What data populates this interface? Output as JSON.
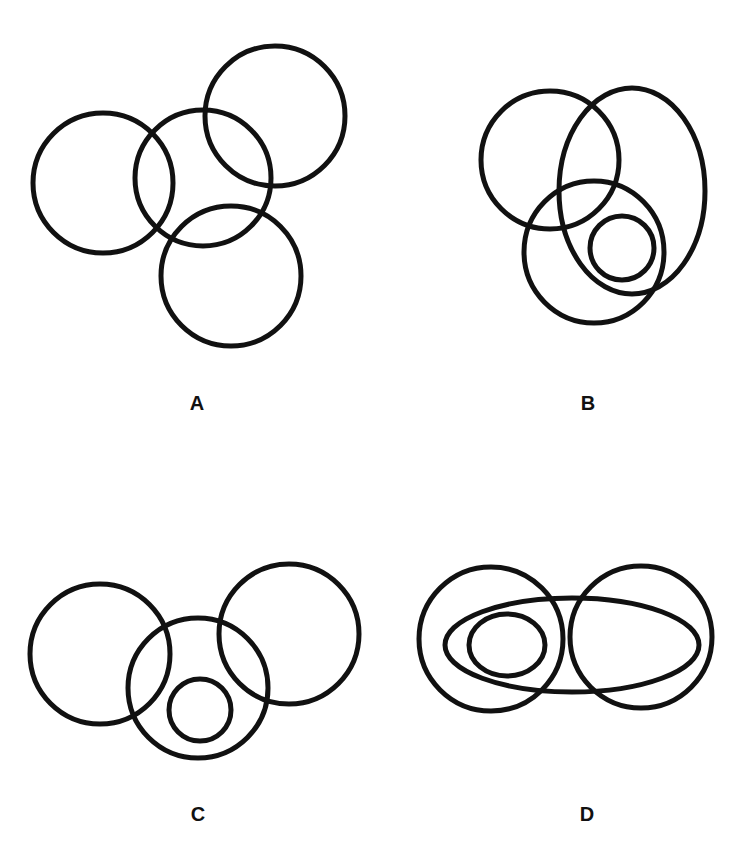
{
  "stroke_color": "#111111",
  "background_color": "#ffffff",
  "panels": [
    {
      "label": "A",
      "label_pos": [
        197,
        403
      ],
      "shapes": [
        {
          "type": "circle",
          "cx": 103,
          "cy": 183,
          "r": 70
        },
        {
          "type": "circle",
          "cx": 203,
          "cy": 178,
          "r": 68
        },
        {
          "type": "circle",
          "cx": 275,
          "cy": 116,
          "r": 70
        },
        {
          "type": "circle",
          "cx": 231,
          "cy": 276,
          "r": 70
        }
      ]
    },
    {
      "label": "B",
      "label_pos": [
        588,
        403
      ],
      "shapes": [
        {
          "type": "circle",
          "cx": 550,
          "cy": 160,
          "r": 69
        },
        {
          "type": "ellipse",
          "cx": 632,
          "cy": 191,
          "rx": 73,
          "ry": 103
        },
        {
          "type": "ellipse",
          "cx": 594,
          "cy": 252,
          "rx": 70,
          "ry": 71
        },
        {
          "type": "circle",
          "cx": 622,
          "cy": 248,
          "r": 32
        }
      ]
    },
    {
      "label": "C",
      "label_pos": [
        198,
        814
      ],
      "shapes": [
        {
          "type": "circle",
          "cx": 100,
          "cy": 654,
          "r": 70
        },
        {
          "type": "circle",
          "cx": 198,
          "cy": 688,
          "r": 70
        },
        {
          "type": "circle",
          "cx": 289,
          "cy": 634,
          "r": 70
        },
        {
          "type": "circle",
          "cx": 200,
          "cy": 710,
          "r": 31
        }
      ]
    },
    {
      "label": "D",
      "label_pos": [
        587,
        814
      ],
      "shapes": [
        {
          "type": "circle",
          "cx": 491,
          "cy": 639,
          "r": 72
        },
        {
          "type": "circle",
          "cx": 641,
          "cy": 637,
          "r": 71
        },
        {
          "type": "ellipse",
          "cx": 572,
          "cy": 645,
          "rx": 127,
          "ry": 47
        },
        {
          "type": "ellipse",
          "cx": 507,
          "cy": 645,
          "rx": 38,
          "ry": 31
        }
      ]
    }
  ]
}
